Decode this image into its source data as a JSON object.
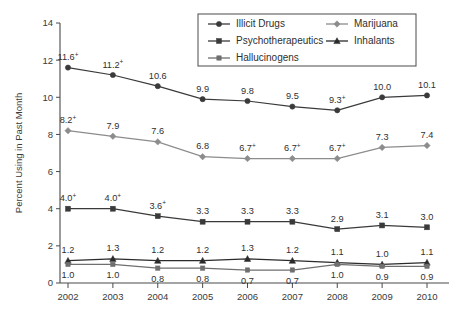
{
  "chart_data": {
    "type": "line",
    "title": "",
    "xlabel": "",
    "ylabel": "Percent Using in Past Month",
    "categories": [
      "2002",
      "2003",
      "2004",
      "2005",
      "2006",
      "2007",
      "2008",
      "2009",
      "2010"
    ],
    "x": [
      2002,
      2003,
      2004,
      2005,
      2006,
      2007,
      2008,
      2009,
      2010
    ],
    "ylim": [
      0,
      14
    ],
    "yticks": [
      0,
      2,
      4,
      6,
      8,
      10,
      12,
      14
    ],
    "ytick_labels": [
      "0",
      "2",
      "4",
      "6",
      "8",
      "10",
      "12",
      "14"
    ],
    "grid": false,
    "legend_position": "top-center",
    "annotation_note": "+ denotes statistically significant difference from 2010",
    "series": [
      {
        "name": "Illicit Drugs",
        "marker": "circle",
        "color": "#3a3a3a",
        "values": [
          11.6,
          11.2,
          10.6,
          9.9,
          9.8,
          9.5,
          9.3,
          10.0,
          10.1
        ],
        "labels": [
          "11.6",
          "11.2",
          "10.6",
          "9.9",
          "9.8",
          "9.5",
          "9.3",
          "10.0",
          "10.1"
        ],
        "significance": [
          true,
          true,
          false,
          false,
          false,
          false,
          true,
          false,
          false
        ],
        "label_position": "above"
      },
      {
        "name": "Marijuana",
        "marker": "diamond",
        "color": "#8c8c8c",
        "values": [
          8.2,
          7.9,
          7.6,
          6.8,
          6.7,
          6.7,
          6.7,
          7.3,
          7.4
        ],
        "labels": [
          "8.2",
          "7.9",
          "7.6",
          "6.8",
          "6.7",
          "6.7",
          "6.7",
          "7.3",
          "7.4"
        ],
        "significance": [
          true,
          false,
          false,
          false,
          true,
          true,
          true,
          false,
          false
        ],
        "label_position": "above"
      },
      {
        "name": "Psychotherapeutics",
        "marker": "square",
        "color": "#3a3a3a",
        "values": [
          4.0,
          4.0,
          3.6,
          3.3,
          3.3,
          3.3,
          2.9,
          3.1,
          3.0
        ],
        "labels": [
          "4.0",
          "4.0",
          "3.6",
          "3.3",
          "3.3",
          "3.3",
          "2.9",
          "3.1",
          "3.0"
        ],
        "significance": [
          true,
          true,
          true,
          false,
          false,
          false,
          false,
          false,
          false
        ],
        "label_position": "above"
      },
      {
        "name": "Inhalants",
        "marker": "triangle",
        "color": "#2b2b2b",
        "values": [
          1.2,
          1.3,
          1.2,
          1.2,
          1.3,
          1.2,
          1.1,
          1.0,
          1.1
        ],
        "labels": [
          "1.2",
          "1.3",
          "1.2",
          "1.2",
          "1.3",
          "1.2",
          "1.1",
          "1.0",
          "1.1"
        ],
        "significance": [
          false,
          false,
          false,
          false,
          false,
          false,
          false,
          false,
          false
        ],
        "label_position": "above"
      },
      {
        "name": "Hallucinogens",
        "marker": "square-small",
        "color": "#6f6f6f",
        "values": [
          1.0,
          1.0,
          0.8,
          0.8,
          0.7,
          0.7,
          1.0,
          0.9,
          0.9
        ],
        "labels": [
          "1.0",
          "1.0",
          "0.8",
          "0.8",
          "0.7",
          "0.7",
          "1.0",
          "0.9",
          "0.9"
        ],
        "significance": [
          false,
          false,
          false,
          false,
          false,
          false,
          false,
          false,
          false
        ],
        "label_position": "below"
      }
    ]
  },
  "legend": {
    "entries": [
      {
        "label": "Illicit Drugs",
        "marker": "circle",
        "color": "#3a3a3a"
      },
      {
        "label": "Marijuana",
        "marker": "diamond",
        "color": "#8c8c8c"
      },
      {
        "label": "Psychotherapeutics",
        "marker": "square",
        "color": "#3a3a3a"
      },
      {
        "label": "Inhalants",
        "marker": "triangle",
        "color": "#2b2b2b"
      },
      {
        "label": "Hallucinogens",
        "marker": "square-small",
        "color": "#6f6f6f"
      }
    ]
  },
  "colors": {
    "axis": "#4a4a4a",
    "text": "#2f2f2f",
    "background": "#ffffff"
  }
}
